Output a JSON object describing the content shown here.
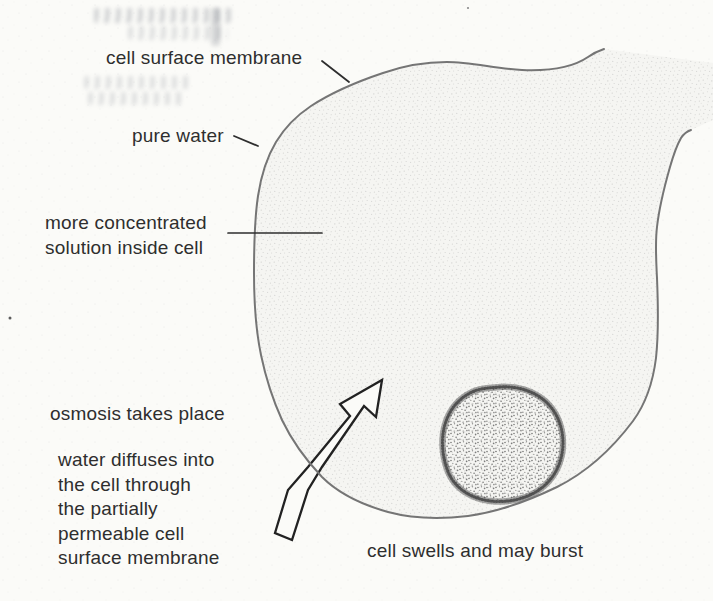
{
  "labels": {
    "cell_surface_membrane": "cell surface membrane",
    "pure_water": "pure water",
    "more_concentrated": {
      "lines": [
        "more concentrated",
        "solution inside cell"
      ]
    },
    "osmosis_takes_place": "osmosis takes place",
    "water_diffuses": {
      "lines": [
        "water diffuses into",
        "the cell through",
        "the partially",
        "permeable cell",
        "surface membrane"
      ]
    },
    "cell_swells": "cell swells and may burst"
  },
  "icons": {
    "water_entry_arrow": "hollow-arrow-up-right"
  },
  "colors": {
    "paper": "#fbfbf8",
    "ink": "#2e2e2e",
    "membrane": "#757575",
    "arrow_outline": "#222222",
    "cytoplasm_tint": "#f5f5f2",
    "nucleus_dots": "#4f4f4f"
  }
}
